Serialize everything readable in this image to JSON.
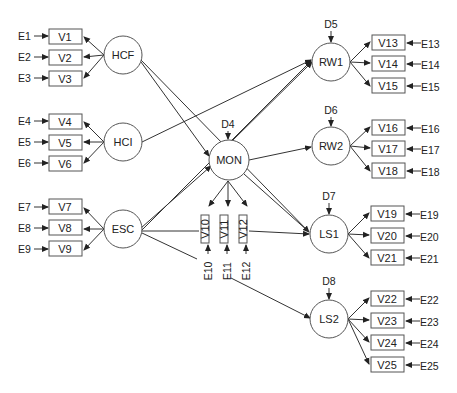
{
  "diagram": {
    "type": "structural-equation-model",
    "latent": {
      "HCF": "HCF",
      "HCI": "HCI",
      "ESC": "ESC",
      "MON": "MON",
      "RW1": "RW1",
      "RW2": "RW2",
      "LS1": "LS1",
      "LS2": "LS2"
    },
    "disturbances": {
      "D4": "D4",
      "D5": "D5",
      "D6": "D6",
      "D7": "D7",
      "D8": "D8"
    },
    "indicators": {
      "V1": "V1",
      "V2": "V2",
      "V3": "V3",
      "V4": "V4",
      "V5": "V5",
      "V6": "V6",
      "V7": "V7",
      "V8": "V8",
      "V9": "V9",
      "V10": "V10",
      "V11": "V11",
      "V12": "V12",
      "V13": "V13",
      "V14": "V14",
      "V15": "V15",
      "V16": "V16",
      "V17": "V17",
      "V18": "V18",
      "V19": "V19",
      "V20": "V20",
      "V21": "V21",
      "V22": "V22",
      "V23": "V23",
      "V24": "V24",
      "V25": "V25"
    },
    "errors": {
      "E1": "E1",
      "E2": "E2",
      "E3": "E3",
      "E4": "E4",
      "E5": "E5",
      "E6": "E6",
      "E7": "E7",
      "E8": "E8",
      "E9": "E9",
      "E10": "E10",
      "E11": "E11",
      "E12": "E12",
      "E13": "E13",
      "E14": "E14",
      "E15": "E15",
      "E16": "E16",
      "E17": "E17",
      "E18": "E18",
      "E19": "E19",
      "E20": "E20",
      "E21": "E21",
      "E22": "E22",
      "E23": "E23",
      "E24": "E24",
      "E25": "E25"
    },
    "measurement": [
      {
        "latent": "HCF",
        "indicators": [
          "V1",
          "V2",
          "V3"
        ]
      },
      {
        "latent": "HCI",
        "indicators": [
          "V4",
          "V5",
          "V6"
        ]
      },
      {
        "latent": "ESC",
        "indicators": [
          "V7",
          "V8",
          "V9"
        ]
      },
      {
        "latent": "MON",
        "indicators": [
          "V10",
          "V11",
          "V12"
        ]
      },
      {
        "latent": "RW1",
        "indicators": [
          "V13",
          "V14",
          "V15"
        ]
      },
      {
        "latent": "RW2",
        "indicators": [
          "V16",
          "V17",
          "V18"
        ]
      },
      {
        "latent": "LS1",
        "indicators": [
          "V19",
          "V20",
          "V21"
        ]
      },
      {
        "latent": "LS2",
        "indicators": [
          "V22",
          "V23",
          "V24",
          "V25"
        ]
      }
    ],
    "structural_paths": [
      {
        "from": "HCF",
        "to": "MON"
      },
      {
        "from": "HCF",
        "to": "LS1"
      },
      {
        "from": "HCI",
        "to": "RW1"
      },
      {
        "from": "ESC",
        "to": "MON"
      },
      {
        "from": "ESC",
        "to": "RW1"
      },
      {
        "from": "ESC",
        "to": "LS1"
      },
      {
        "from": "ESC",
        "to": "LS2"
      },
      {
        "from": "MON",
        "to": "RW1"
      },
      {
        "from": "MON",
        "to": "RW2"
      },
      {
        "from": "MON",
        "to": "LS1"
      }
    ],
    "colors": {
      "stroke": "#333333",
      "background": "#ffffff",
      "text": "#222222"
    }
  }
}
